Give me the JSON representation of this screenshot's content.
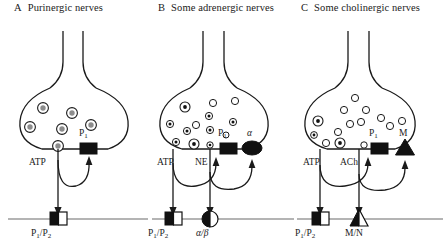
{
  "figure": {
    "type": "diagram"
  },
  "panels": [
    {
      "letter": "A",
      "title": "Purinergic nerves",
      "vesicles": {
        "style": "ring-with-gray-core",
        "count": 6,
        "contents": "ATP"
      },
      "transmitters": [
        {
          "label": "ATP"
        }
      ],
      "prejunctional_receptors": [
        {
          "label": "P",
          "sub": "1",
          "shape": "filled-square"
        }
      ],
      "postjunctional_receptors": [
        {
          "label": "P₁/P₂",
          "shape": "half-filled-square"
        }
      ]
    },
    {
      "letter": "B",
      "title": "Some adrenergic nerves",
      "vesicles": {
        "style": "mixed-dotted-and-open",
        "dotted_count": 9,
        "open_count": 4,
        "contents": "ATP and NE"
      },
      "transmitters": [
        {
          "label": "ATP"
        },
        {
          "label": "NE"
        }
      ],
      "prejunctional_receptors": [
        {
          "label": "P",
          "sub": "1",
          "shape": "filled-square"
        },
        {
          "label": "α",
          "shape": "filled-ellipse"
        }
      ],
      "postjunctional_receptors": [
        {
          "label": "P₁/P₂",
          "shape": "half-filled-square"
        },
        {
          "label": "α/β",
          "shape": "half-filled-circle"
        }
      ]
    },
    {
      "letter": "C",
      "title": "Some cholinergic nerves",
      "vesicles": {
        "style": "mixed-open-and-dotted",
        "open_count": 11,
        "dotted_count": 3,
        "contents": "ATP and ACh"
      },
      "transmitters": [
        {
          "label": "ATP"
        },
        {
          "label": "ACh"
        }
      ],
      "prejunctional_receptors": [
        {
          "label": "P",
          "sub": "1",
          "shape": "filled-square"
        },
        {
          "label": "M",
          "shape": "filled-triangle"
        }
      ],
      "postjunctional_receptors": [
        {
          "label": "P₁/P₂",
          "shape": "half-filled-square"
        },
        {
          "label": "M/N",
          "shape": "half-filled-triangle"
        }
      ]
    }
  ],
  "colors": {
    "stroke": "#1a1a1a",
    "vesicle_core": "#8c8c8c",
    "target_line": "#6b6b6b",
    "fill_black": "#111111",
    "fill_white": "#ffffff"
  }
}
